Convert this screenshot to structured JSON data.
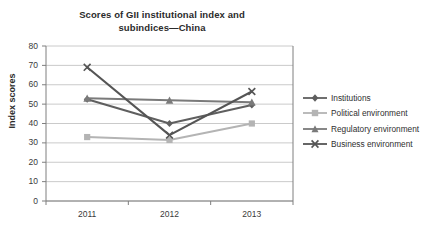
{
  "chart_data": {
    "type": "line",
    "title": "Scores of GII institutional index and subindices—China",
    "title_line1": "Scores of GII institutional index and",
    "title_line2": "subindices—China",
    "xlabel": "",
    "ylabel": "Index scores",
    "categories": [
      "2011",
      "2012",
      "2013"
    ],
    "ylim": [
      0,
      80
    ],
    "yticks": [
      0,
      10,
      20,
      30,
      40,
      50,
      60,
      70,
      80
    ],
    "ytick_labels": [
      "0",
      "10",
      "20",
      "30",
      "40",
      "50",
      "60",
      "70",
      "80"
    ],
    "grid": true,
    "grid_axis": "y",
    "legend_position": "right",
    "series": [
      {
        "name": "Institutions",
        "marker": "diamond",
        "color": "#5f5f5f",
        "values": [
          52.5,
          40.0,
          49.5
        ]
      },
      {
        "name": "Political environment",
        "marker": "square",
        "color": "#b4b4b4",
        "values": [
          33.0,
          31.5,
          40.0
        ]
      },
      {
        "name": "Regulatory environment",
        "marker": "triangle",
        "color": "#7a7a7a",
        "values": [
          53.0,
          52.0,
          51.0
        ]
      },
      {
        "name": "Business environment",
        "marker": "x",
        "color": "#555555",
        "values": [
          69.0,
          34.0,
          56.5
        ]
      }
    ]
  },
  "axis": {
    "axis_line_color": "#7f7f7f",
    "grid_line_color": "#bdbdbd"
  },
  "legend": {
    "entries": [
      {
        "label": "Institutions"
      },
      {
        "label": "Political environment"
      },
      {
        "label": "Regulatory environment"
      },
      {
        "label": "Business environment"
      }
    ]
  }
}
